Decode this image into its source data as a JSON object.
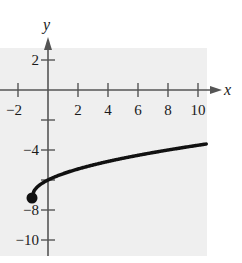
{
  "chart_data": {
    "type": "line",
    "title": "",
    "xlabel": "x",
    "ylabel": "y",
    "xlim": [
      -3,
      10.5
    ],
    "ylim": [
      -11,
      3
    ],
    "grid": false,
    "x_ticks": [
      -2,
      2,
      4,
      6,
      8,
      10
    ],
    "y_ticks": [
      2,
      -4,
      -8,
      -10
    ],
    "x_tick_labels": [
      "−2",
      "2",
      "4",
      "6",
      "8",
      "10"
    ],
    "y_tick_labels": [
      "2",
      "−4",
      "−8",
      "−10"
    ],
    "series": [
      {
        "name": "curve",
        "x": [
          -1,
          -0.5,
          0,
          1,
          2,
          3,
          4,
          5,
          6,
          7,
          8,
          9,
          10
        ],
        "y": [
          -7,
          -6.29,
          -6,
          -5.59,
          -5.27,
          -5,
          -4.76,
          -4.55,
          -4.35,
          -4.17,
          -4,
          -3.84,
          -3.68
        ],
        "endpoint": {
          "x": -1,
          "y": -7,
          "filled": true
        }
      }
    ],
    "colors": {
      "background_panel": "#efefef",
      "line": "#111111",
      "axes": "#555555"
    }
  }
}
